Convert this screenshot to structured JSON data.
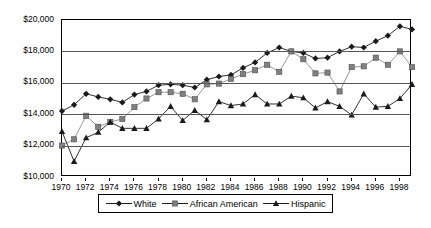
{
  "chart_data": {
    "type": "line",
    "title": "",
    "xlabel": "",
    "ylabel": "",
    "xlim": [
      1970,
      1999
    ],
    "ylim": [
      10000,
      20000
    ],
    "grid": true,
    "legend_position": "bottom",
    "y_ticks": [
      "$20,000",
      "$18,000",
      "$16,000",
      "$14,000",
      "$12,000",
      "$10,000"
    ],
    "y_tick_values": [
      20000,
      18000,
      16000,
      14000,
      12000,
      10000
    ],
    "x_ticks": [
      "1970",
      "1972",
      "1974",
      "1976",
      "1978",
      "1980",
      "1982",
      "1984",
      "1986",
      "1988",
      "1990",
      "1992",
      "1994",
      "1996",
      "1998"
    ],
    "x": [
      1970,
      1971,
      1972,
      1973,
      1974,
      1975,
      1976,
      1977,
      1978,
      1979,
      1980,
      1981,
      1982,
      1983,
      1984,
      1985,
      1986,
      1987,
      1988,
      1989,
      1990,
      1991,
      1992,
      1993,
      1994,
      1995,
      1996,
      1997,
      1998,
      1999
    ],
    "series": [
      {
        "name": "White",
        "marker": "diamond",
        "color": "#1a1a1a",
        "values": [
          14200,
          14600,
          15300,
          15100,
          14950,
          14750,
          15250,
          15450,
          15850,
          15900,
          15850,
          15700,
          16200,
          16400,
          16500,
          16950,
          17300,
          17900,
          18250,
          18000,
          17900,
          17550,
          17600,
          18000,
          18300,
          18250,
          18650,
          19000,
          19600,
          19400
        ]
      },
      {
        "name": "African American",
        "marker": "square",
        "color": "#808080",
        "values": [
          12000,
          12400,
          13900,
          13200,
          13500,
          13700,
          14450,
          15000,
          15400,
          15400,
          15300,
          14950,
          15900,
          15950,
          16250,
          16550,
          16800,
          17150,
          16700,
          18000,
          17500,
          16600,
          16650,
          15450,
          17000,
          17050,
          17600,
          17150,
          18000,
          17000
        ]
      },
      {
        "name": "Hispanic",
        "marker": "triangle",
        "color": "#1a1a1a",
        "values": [
          12900,
          11000,
          12500,
          12850,
          13500,
          13100,
          13100,
          13100,
          13700,
          14500,
          13600,
          14250,
          13650,
          14800,
          14550,
          14650,
          15250,
          14650,
          14650,
          15150,
          15050,
          14400,
          14800,
          14500,
          13950,
          15300,
          14450,
          14500,
          15000,
          15900
        ]
      }
    ]
  },
  "legend": {
    "items": [
      {
        "label": "White",
        "marker": "diamond"
      },
      {
        "label": "African American",
        "marker": "square"
      },
      {
        "label": "Hispanic",
        "marker": "triangle"
      }
    ]
  }
}
